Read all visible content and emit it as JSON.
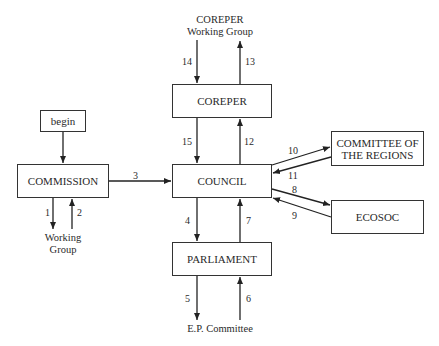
{
  "diagram": {
    "nodes": {
      "begin": "begin",
      "commission": "COMMISSION",
      "coreper": "COREPER",
      "council": "COUNCIL",
      "parliament": "PARLIAMENT",
      "cor_line1": "COMMITTEE OF",
      "cor_line2": "THE REGIONS",
      "ecosoc": "ECOSOC"
    },
    "labels": {
      "coreper_wg_line1": "COREPER",
      "coreper_wg_line2": "Working Group",
      "wg_line1": "Working",
      "wg_line2": "Group",
      "ep_committee": "E.P. Committee"
    },
    "edges": [
      {
        "id": "1",
        "from": "COMMISSION",
        "to": "Working Group"
      },
      {
        "id": "2",
        "from": "Working Group",
        "to": "COMMISSION"
      },
      {
        "id": "3",
        "from": "COMMISSION",
        "to": "COUNCIL"
      },
      {
        "id": "4",
        "from": "COUNCIL",
        "to": "PARLIAMENT"
      },
      {
        "id": "5",
        "from": "PARLIAMENT",
        "to": "E.P. Committee"
      },
      {
        "id": "6",
        "from": "E.P. Committee",
        "to": "PARLIAMENT"
      },
      {
        "id": "7",
        "from": "PARLIAMENT",
        "to": "COUNCIL"
      },
      {
        "id": "8",
        "from": "COUNCIL",
        "to": "ECOSOC"
      },
      {
        "id": "9",
        "from": "ECOSOC",
        "to": "COUNCIL"
      },
      {
        "id": "10",
        "from": "COUNCIL",
        "to": "COMMITTEE OF THE REGIONS"
      },
      {
        "id": "11",
        "from": "COMMITTEE OF THE REGIONS",
        "to": "COUNCIL"
      },
      {
        "id": "12",
        "from": "COUNCIL",
        "to": "COREPER"
      },
      {
        "id": "13",
        "from": "COREPER",
        "to": "COREPER Working Group"
      },
      {
        "id": "14",
        "from": "COREPER Working Group",
        "to": "COREPER"
      },
      {
        "id": "15",
        "from": "COREPER",
        "to": "COUNCIL"
      }
    ]
  }
}
